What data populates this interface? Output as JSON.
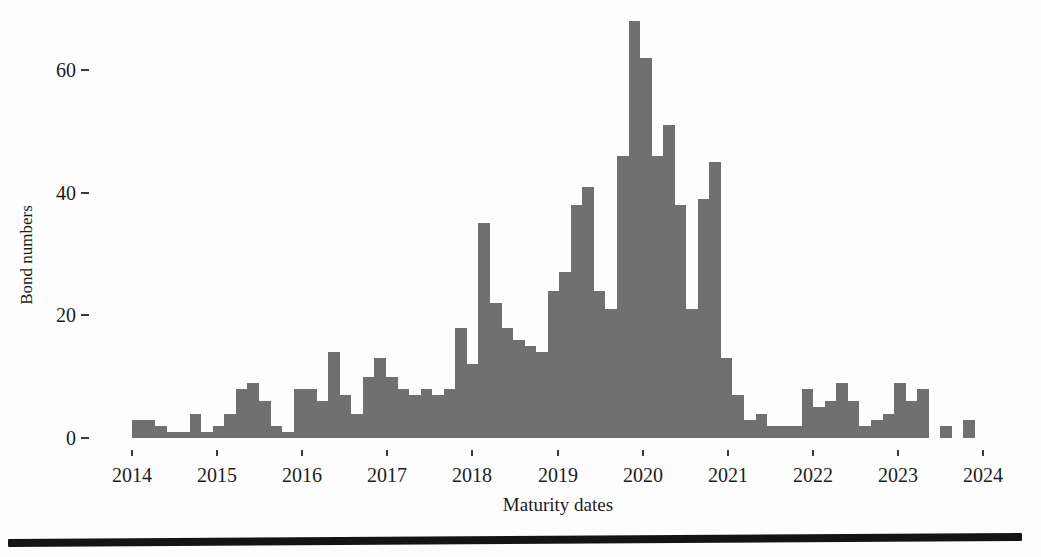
{
  "figure": {
    "xlabel": "Maturity dates",
    "ylabel": "Bond numbers"
  },
  "chart_data": {
    "type": "bar",
    "title": "",
    "xlabel": "Maturity dates",
    "ylabel": "Bond numbers",
    "legend": null,
    "grid": false,
    "x_tick_labels": [
      "2014",
      "2015",
      "2016",
      "2017",
      "2018",
      "2019",
      "2020",
      "2021",
      "2022",
      "2023",
      "2024"
    ],
    "y_tick_values": [
      0,
      20,
      40,
      60
    ],
    "ylim": [
      0,
      70
    ],
    "xlim_years": [
      2014,
      2024
    ],
    "bin_start_year": 2014,
    "bin_width_years": 0.1357,
    "bar_color": "#707070",
    "values": [
      3,
      3,
      2,
      1,
      1,
      4,
      1,
      2,
      4,
      8,
      9,
      6,
      2,
      1,
      8,
      8,
      6,
      14,
      7,
      4,
      10,
      13,
      10,
      8,
      7,
      8,
      7,
      8,
      18,
      12,
      35,
      22,
      18,
      16,
      15,
      14,
      24,
      27,
      38,
      41,
      24,
      21,
      46,
      68,
      62,
      46,
      51,
      38,
      21,
      39,
      45,
      13,
      7,
      3,
      4,
      2,
      2,
      2,
      8,
      5,
      6,
      9,
      6,
      2,
      3,
      4,
      9,
      6,
      8,
      0,
      2,
      0,
      3
    ]
  }
}
